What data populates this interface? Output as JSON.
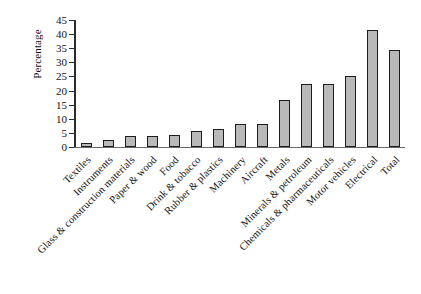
{
  "chart_data": {
    "type": "bar",
    "title": "",
    "xlabel": "",
    "ylabel": "Percentage",
    "ylim": [
      0,
      45
    ],
    "yticks": [
      0,
      5,
      10,
      15,
      20,
      25,
      30,
      35,
      40,
      45
    ],
    "grid": false,
    "legend": null,
    "categories": [
      "Textiles",
      "Instruments",
      "Glass & construction materials",
      "Paper & wood",
      "Food",
      "Drink & tobacco",
      "Rubber & plastics",
      "Machinery",
      "Aircraft",
      "Metals",
      "Minerals & petroleum",
      "Chemicals & pharmaceuticals",
      "Motor vehicles",
      "Electrical",
      "Total"
    ],
    "values": [
      1.5,
      2.5,
      4.0,
      3.8,
      4.2,
      5.5,
      6.3,
      8.0,
      8.3,
      16.5,
      22.3,
      22.2,
      25.0,
      41.5,
      34.5
    ],
    "bar_color": "#b9b9b9",
    "bar_edge_color": "#1d1d1d",
    "axis_color": "#2b2b2b",
    "background_color": "#ffffff"
  }
}
